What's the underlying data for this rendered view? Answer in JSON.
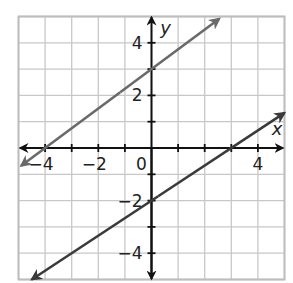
{
  "chart_data": {
    "type": "line",
    "title": "",
    "xlabel": "x",
    "ylabel": "y",
    "xlim": [
      -5,
      5
    ],
    "ylim": [
      -5,
      5
    ],
    "grid": true,
    "grid_step": 1,
    "x_ticks": [
      -4,
      -2,
      0,
      4
    ],
    "y_ticks": [
      4,
      2,
      -2,
      -4
    ],
    "x_tick_labels": [
      "−4",
      "−2",
      "0",
      "4"
    ],
    "y_tick_labels": [
      "4",
      "2",
      "−2",
      "−4"
    ],
    "series": [
      {
        "name": "upper line",
        "equation": "y = 3/4 x + 3",
        "slope": 0.75,
        "intercept": 3,
        "points": [
          [
            -4,
            0
          ],
          [
            0,
            3
          ]
        ],
        "x_range": [
          -4.9,
          2.55
        ],
        "arrows": "both",
        "color": "#6a6a6a"
      },
      {
        "name": "lower line",
        "equation": "y = 2/3 x - 2",
        "slope": 0.6667,
        "intercept": -2,
        "points": [
          [
            0,
            -2
          ],
          [
            3,
            0
          ]
        ],
        "x_range": [
          -4.5,
          5
        ],
        "arrows": "both",
        "color": "#3a3a3a"
      }
    ],
    "legend": null
  },
  "colors": {
    "grid": "#c8c8c8",
    "axes": "#111111",
    "border": "#bdbdbd"
  }
}
